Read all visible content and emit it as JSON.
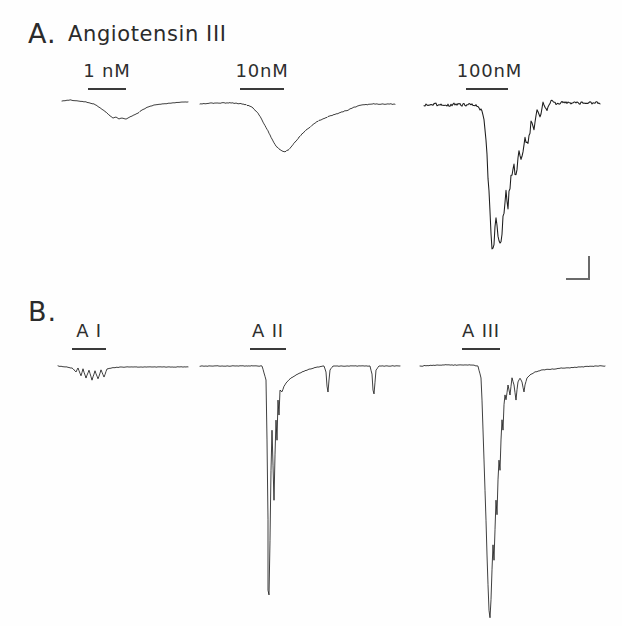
{
  "figure": {
    "background_color": "#fefefe",
    "trace_color": "#1d1d1d",
    "label_color": "#2b2b2b"
  },
  "panels": [
    {
      "letter": "A.",
      "title": "Angiotensin III",
      "traces": [
        {
          "label": "1 nM"
        },
        {
          "label": "10nM"
        },
        {
          "label": "100nM"
        }
      ]
    },
    {
      "letter": "B.",
      "title": "",
      "traces": [
        {
          "label": "A I"
        },
        {
          "label": "A II"
        },
        {
          "label": "A III"
        }
      ]
    }
  ],
  "scale_bar": {
    "label": "",
    "orientation": "L-shaped"
  },
  "chart_data": {
    "type": "line",
    "title": "A. Angiotensin III",
    "xlabel": "",
    "ylabel": "",
    "grid": false,
    "legend": "none",
    "panels": [
      {
        "name": "A",
        "letter": "A.",
        "title": "Angiotensin III",
        "series": [
          {
            "name": "1 nM",
            "label": "1 nM",
            "baseline_y": 103,
            "peak_amplitude_px": 16,
            "noise_level": "low",
            "bar": {
              "x0": 88,
              "x1": 126,
              "y": 88
            },
            "label_pos": {
              "x": 107,
              "y": 62
            },
            "points": [
              [
                62,
                101
              ],
              [
                70,
                100
              ],
              [
                78,
                101
              ],
              [
                86,
                102
              ],
              [
                94,
                104
              ],
              [
                99,
                107
              ],
              [
                103,
                110
              ],
              [
                107,
                113
              ],
              [
                110,
                116
              ],
              [
                113,
                118
              ],
              [
                116,
                117
              ],
              [
                119,
                119
              ],
              [
                122,
                118
              ],
              [
                126,
                119
              ],
              [
                130,
                117
              ],
              [
                134,
                115
              ],
              [
                138,
                113
              ],
              [
                142,
                110
              ],
              [
                148,
                107
              ],
              [
                154,
                105
              ],
              [
                162,
                104
              ],
              [
                172,
                103
              ],
              [
                182,
                102
              ],
              [
                188,
                102
              ]
            ]
          },
          {
            "name": "10 nM",
            "label": "10nM",
            "baseline_y": 103,
            "peak_amplitude_px": 48,
            "noise_level": "medium",
            "bar": {
              "x0": 240,
              "x1": 284,
              "y": 88
            },
            "label_pos": {
              "x": 262,
              "y": 62
            },
            "points": [
              [
                200,
                104
              ],
              [
                215,
                103
              ],
              [
                230,
                103
              ],
              [
                244,
                104
              ],
              [
                252,
                107
              ],
              [
                258,
                113
              ],
              [
                263,
                122
              ],
              [
                268,
                131
              ],
              [
                272,
                139
              ],
              [
                276,
                146
              ],
              [
                280,
                150
              ],
              [
                284,
                152
              ],
              [
                288,
                150
              ],
              [
                292,
                146
              ],
              [
                296,
                141
              ],
              [
                300,
                136
              ],
              [
                305,
                131
              ],
              [
                310,
                127
              ],
              [
                315,
                123
              ],
              [
                320,
                120
              ],
              [
                325,
                118
              ],
              [
                330,
                116
              ],
              [
                336,
                114
              ],
              [
                342,
                112
              ],
              [
                348,
                110
              ],
              [
                355,
                107
              ],
              [
                362,
                105
              ],
              [
                372,
                104
              ],
              [
                385,
                104
              ],
              [
                395,
                104
              ]
            ]
          },
          {
            "name": "100 nM",
            "label": "100nM",
            "baseline_y": 104,
            "peak_amplitude_px": 150,
            "noise_level": "high",
            "bar": {
              "x0": 466,
              "x1": 508,
              "y": 88
            },
            "label_pos": {
              "x": 487,
              "y": 62
            },
            "points": [
              [
                424,
                105
              ],
              [
                435,
                104
              ],
              [
                445,
                106
              ],
              [
                455,
                104
              ],
              [
                463,
                105
              ],
              [
                470,
                104
              ],
              [
                476,
                106
              ],
              [
                482,
                110
              ],
              [
                485,
                125
              ],
              [
                487,
                150
              ],
              [
                488,
                175
              ],
              [
                489,
                195
              ],
              [
                490,
                215
              ],
              [
                491,
                235
              ],
              [
                492,
                250
              ],
              [
                494,
                240
              ],
              [
                496,
                220
              ],
              [
                498,
                235
              ],
              [
                500,
                245
              ],
              [
                502,
                230
              ],
              [
                504,
                210
              ],
              [
                506,
                195
              ],
              [
                508,
                205
              ],
              [
                510,
                185
              ],
              [
                513,
                165
              ],
              [
                516,
                175
              ],
              [
                519,
                150
              ],
              [
                522,
                160
              ],
              [
                525,
                135
              ],
              [
                528,
                145
              ],
              [
                531,
                120
              ],
              [
                534,
                130
              ],
              [
                537,
                110
              ],
              [
                540,
                118
              ],
              [
                543,
                103
              ],
              [
                547,
                110
              ],
              [
                551,
                100
              ],
              [
                556,
                104
              ],
              [
                562,
                102
              ],
              [
                570,
                103
              ],
              [
                580,
                103
              ],
              [
                592,
                103
              ],
              [
                600,
                103
              ]
            ]
          }
        ]
      },
      {
        "name": "B",
        "letter": "B.",
        "title": "",
        "series": [
          {
            "name": "A I",
            "label": "A I",
            "baseline_y": 368,
            "peak_amplitude_px": 14,
            "noise_level": "spiky-small",
            "bar": {
              "x0": 72,
              "x1": 106,
              "y": 348
            },
            "label_pos": {
              "x": 89,
              "y": 322
            },
            "points": [
              [
                58,
                366
              ],
              [
                66,
                367
              ],
              [
                72,
                368
              ],
              [
                76,
                372
              ],
              [
                78,
                368
              ],
              [
                81,
                376
              ],
              [
                83,
                369
              ],
              [
                86,
                378
              ],
              [
                89,
                370
              ],
              [
                92,
                380
              ],
              [
                95,
                371
              ],
              [
                98,
                379
              ],
              [
                101,
                370
              ],
              [
                104,
                377
              ],
              [
                107,
                369
              ],
              [
                112,
                368
              ],
              [
                120,
                367
              ],
              [
                132,
                367
              ],
              [
                145,
                367
              ],
              [
                160,
                367
              ],
              [
                175,
                367
              ],
              [
                188,
                367
              ]
            ]
          },
          {
            "name": "A II",
            "label": "A II",
            "baseline_y": 367,
            "peak_amplitude_px": 235,
            "noise_level": "sharp-spike",
            "bar": {
              "x0": 250,
              "x1": 286,
              "y": 348
            },
            "label_pos": {
              "x": 268,
              "y": 322
            },
            "points": [
              [
                200,
                366
              ],
              [
                220,
                366
              ],
              [
                240,
                366
              ],
              [
                255,
                366
              ],
              [
                262,
                366
              ],
              [
                266,
                380
              ],
              [
                267,
                440
              ],
              [
                268,
                520
              ],
              [
                268,
                590
              ],
              [
                269,
                595
              ],
              [
                270,
                540
              ],
              [
                271,
                470
              ],
              [
                272,
                430
              ],
              [
                273,
                465
              ],
              [
                274,
                500
              ],
              [
                275,
                455
              ],
              [
                276,
                420
              ],
              [
                277,
                440
              ],
              [
                278,
                400
              ],
              [
                279,
                415
              ],
              [
                280,
                390
              ],
              [
                282,
                392
              ],
              [
                284,
                386
              ],
              [
                287,
                382
              ],
              [
                291,
                378
              ],
              [
                296,
                375
              ],
              [
                302,
                372
              ],
              [
                310,
                369
              ],
              [
                318,
                367
              ],
              [
                324,
                366
              ],
              [
                326,
                372
              ],
              [
                327,
                386
              ],
              [
                328,
                392
              ],
              [
                329,
                380
              ],
              [
                330,
                370
              ],
              [
                333,
                366
              ],
              [
                345,
                366
              ],
              [
                360,
                366
              ],
              [
                370,
                366
              ],
              [
                372,
                374
              ],
              [
                373,
                390
              ],
              [
                374,
                394
              ],
              [
                375,
                382
              ],
              [
                376,
                370
              ],
              [
                379,
                366
              ],
              [
                390,
                366
              ],
              [
                400,
                366
              ]
            ]
          },
          {
            "name": "A III",
            "label": "A III",
            "baseline_y": 366,
            "peak_amplitude_px": 255,
            "noise_level": "deep-v-slow-recovery",
            "bar": {
              "x0": 462,
              "x1": 500,
              "y": 348
            },
            "label_pos": {
              "x": 481,
              "y": 322
            },
            "points": [
              [
                420,
                366
              ],
              [
                440,
                365
              ],
              [
                458,
                365
              ],
              [
                472,
                365
              ],
              [
                478,
                366
              ],
              [
                481,
                378
              ],
              [
                482,
                400
              ],
              [
                483,
                430
              ],
              [
                484,
                460
              ],
              [
                485,
                490
              ],
              [
                486,
                520
              ],
              [
                487,
                555
              ],
              [
                488,
                585
              ],
              [
                489,
                610
              ],
              [
                490,
                618
              ],
              [
                491,
                600
              ],
              [
                492,
                570
              ],
              [
                493,
                545
              ],
              [
                494,
                560
              ],
              [
                495,
                530
              ],
              [
                496,
                500
              ],
              [
                497,
                515
              ],
              [
                498,
                480
              ],
              [
                499,
                460
              ],
              [
                500,
                470
              ],
              [
                501,
                440
              ],
              [
                502,
                420
              ],
              [
                503,
                430
              ],
              [
                504,
                405
              ],
              [
                505,
                395
              ],
              [
                506,
                400
              ],
              [
                508,
                385
              ],
              [
                510,
                395
              ],
              [
                512,
                378
              ],
              [
                514,
                385
              ],
              [
                516,
                400
              ],
              [
                517,
                390
              ],
              [
                518,
                382
              ],
              [
                520,
                378
              ],
              [
                522,
                382
              ],
              [
                524,
                392
              ],
              [
                525,
                385
              ],
              [
                527,
                378
              ],
              [
                530,
                375
              ],
              [
                535,
                372
              ],
              [
                542,
                370
              ],
              [
                552,
                369
              ],
              [
                565,
                368
              ],
              [
                580,
                367
              ],
              [
                595,
                366
              ],
              [
                605,
                366
              ]
            ]
          }
        ]
      }
    ]
  }
}
